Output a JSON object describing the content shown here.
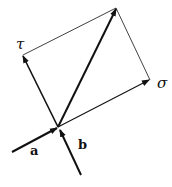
{
  "diagram": {
    "labels": {
      "tau": "τ",
      "sigma": "σ",
      "a": "a",
      "b": "b"
    },
    "colors": {
      "stroke": "#111111",
      "background": "#ffffff"
    },
    "points": {
      "origin": [
        58,
        127
      ],
      "apex": [
        116,
        8
      ],
      "tau_tip": [
        23,
        55
      ],
      "sigma_tip": [
        150,
        80
      ],
      "a_start": [
        12,
        152
      ],
      "b_start": [
        81,
        175
      ]
    }
  }
}
